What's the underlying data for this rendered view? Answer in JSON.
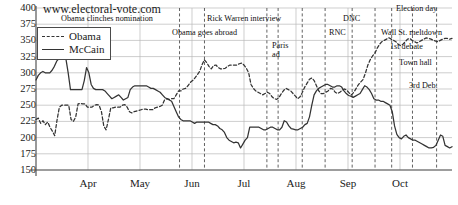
{
  "site": "www.electoral-vote.com",
  "legend": {
    "position": "top-left-inside",
    "entries": [
      {
        "label": "Obama",
        "style": "dashed",
        "color": "#333333"
      },
      {
        "label": "McCain",
        "style": "solid",
        "color": "#333333"
      }
    ]
  },
  "chart_data": {
    "type": "line",
    "title": "www.electoral-vote.com",
    "xlabel": "",
    "ylabel": "",
    "ylim": [
      150,
      400
    ],
    "yticks": [
      400,
      375,
      350,
      325,
      300,
      275,
      250,
      225,
      200,
      175,
      150
    ],
    "grid": true,
    "xticks": [
      "Apr",
      "May",
      "Jun",
      "Jul",
      "Aug",
      "Sep",
      "Oct"
    ],
    "xlim_months": [
      "Mar",
      "Nov"
    ],
    "series": [
      {
        "name": "Obama",
        "style": "dashed",
        "color": "#333333",
        "values": [
          228,
          230,
          222,
          226,
          220,
          224,
          216,
          210,
          203,
          227,
          247,
          250,
          250,
          250,
          250,
          228,
          225,
          232,
          252,
          253,
          252,
          252,
          247,
          247,
          247,
          250,
          251,
          250,
          240,
          218,
          212,
          228,
          246,
          246,
          247,
          247,
          247,
          250,
          251,
          247,
          240,
          238,
          240,
          241,
          242,
          243,
          244,
          244,
          243,
          243,
          243,
          246,
          247,
          248,
          250,
          258,
          260,
          259,
          260,
          260,
          266,
          272,
          272,
          275,
          276,
          280,
          285,
          288,
          292,
          297,
          302,
          312,
          320,
          316,
          310,
          306,
          311,
          312,
          308,
          306,
          306,
          307,
          310,
          312,
          312,
          312,
          312,
          314,
          315,
          312,
          307,
          300,
          282,
          276,
          272,
          270,
          268,
          266,
          268,
          270,
          268,
          263,
          260,
          259,
          262,
          268,
          273,
          276,
          274,
          272,
          268,
          264,
          260,
          263,
          270,
          278,
          284,
          290,
          292,
          288,
          280,
          272,
          268,
          268,
          270,
          272,
          276,
          275,
          270,
          268,
          270,
          273,
          275,
          273,
          269,
          266,
          270,
          276,
          282,
          286,
          290,
          300,
          312,
          320,
          326,
          330,
          338,
          344,
          348,
          350,
          352,
          354,
          352,
          350,
          348,
          344,
          342,
          344,
          348,
          352,
          353,
          350,
          348,
          346,
          348,
          350,
          352,
          354,
          353,
          352,
          350,
          349,
          348,
          350,
          352,
          353,
          353,
          352,
          353
        ]
      },
      {
        "name": "McCain",
        "style": "solid",
        "color": "#333333",
        "values": [
          289,
          296,
          300,
          302,
          300,
          300,
          300,
          304,
          310,
          318,
          322,
          322,
          322,
          322,
          300,
          274,
          274,
          274,
          274,
          274,
          274,
          288,
          308,
          300,
          282,
          276,
          274,
          274,
          274,
          274,
          272,
          268,
          264,
          260,
          262,
          264,
          266,
          262,
          258,
          260,
          262,
          274,
          278,
          280,
          280,
          280,
          280,
          280,
          280,
          278,
          276,
          276,
          274,
          272,
          270,
          266,
          262,
          260,
          258,
          256,
          248,
          240,
          232,
          228,
          226,
          226,
          226,
          226,
          224,
          222,
          224,
          224,
          224,
          224,
          224,
          224,
          222,
          220,
          220,
          218,
          214,
          212,
          208,
          200,
          196,
          194,
          192,
          193,
          192,
          184,
          190,
          196,
          200,
          216,
          216,
          216,
          216,
          216,
          214,
          212,
          212,
          214,
          216,
          216,
          214,
          212,
          212,
          216,
          226,
          224,
          218,
          214,
          213,
          212,
          212,
          214,
          216,
          220,
          222,
          232,
          250,
          266,
          272,
          276,
          278,
          280,
          282,
          282,
          280,
          278,
          278,
          280,
          280,
          278,
          272,
          268,
          265,
          264,
          262,
          264,
          266,
          268,
          274,
          280,
          278,
          274,
          268,
          260,
          258,
          258,
          256,
          256,
          254,
          252,
          250,
          240,
          218,
          205,
          200,
          198,
          202,
          204,
          200,
          198,
          196,
          196,
          194,
          192,
          190,
          188,
          186,
          184,
          184,
          185,
          188,
          196,
          204,
          202,
          188,
          186,
          184,
          186
        ]
      }
    ],
    "events": [
      {
        "label": "Obama clinches nomination",
        "x_frac": 0.345
      },
      {
        "label": "Obama goes abroad",
        "x_frac": 0.405
      },
      {
        "label": "Rick Warren interview",
        "x_frac": 0.555
      },
      {
        "label": "Paris ad",
        "x_frac": 0.582
      },
      {
        "label": "DNC",
        "x_frac": 0.64
      },
      {
        "label": "RNC",
        "x_frac": 0.695
      },
      {
        "label": "Wall St. meltdown",
        "x_frac": 0.76
      },
      {
        "label": "1st debate",
        "x_frac": 0.815
      },
      {
        "label": "Town hall",
        "x_frac": 0.855
      },
      {
        "label": "3rd Deb.",
        "x_frac": 0.905
      },
      {
        "label": "Election day",
        "x_frac": 0.963
      }
    ]
  }
}
